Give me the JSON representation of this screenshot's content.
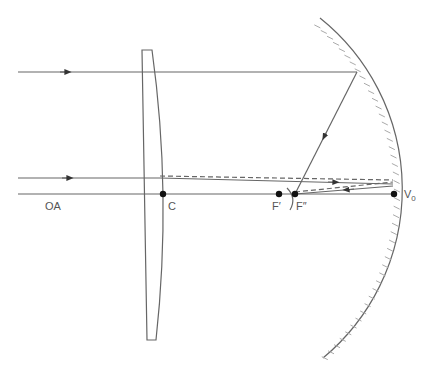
{
  "diagram": {
    "type": "optical ray diagram",
    "labels": {
      "optical_axis": "OA",
      "lens_center": "C",
      "focal_point_1": "F′",
      "focal_point_2": "F″",
      "mirror_vertex": "V",
      "mirror_vertex_sub": "0"
    },
    "points": {
      "C": [
        163,
        194
      ],
      "F_prime": [
        279,
        194
      ],
      "F_double_prime": [
        295,
        194
      ],
      "V0": [
        394,
        194
      ]
    },
    "colors": {
      "line": "#666666",
      "mirror_hatch": "#aaaaaa",
      "label": "#555555",
      "dot": "#111111"
    }
  }
}
